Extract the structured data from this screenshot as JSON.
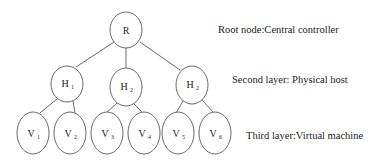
{
  "diagram": {
    "nodes": {
      "root": {
        "label": "R"
      },
      "hosts": [
        {
          "label": "H",
          "sub": "1"
        },
        {
          "label": "H",
          "sub": "2"
        },
        {
          "label": "H",
          "sub": "2"
        }
      ],
      "vms": [
        {
          "label": "V",
          "sub": "1"
        },
        {
          "label": "V",
          "sub": "2"
        },
        {
          "label": "V",
          "sub": "3"
        },
        {
          "label": "V",
          "sub": "4"
        },
        {
          "label": "V",
          "sub": "5"
        },
        {
          "label": "V",
          "sub": "6"
        }
      ]
    },
    "edges": [
      [
        "R",
        "H1"
      ],
      [
        "R",
        "H2"
      ],
      [
        "R",
        "H3"
      ],
      [
        "H1",
        "V1"
      ],
      [
        "H1",
        "V2"
      ],
      [
        "H2",
        "V3"
      ],
      [
        "H2",
        "V4"
      ],
      [
        "H3",
        "V5"
      ],
      [
        "H3",
        "V6"
      ]
    ],
    "layer_labels": {
      "root": "Root node:Central controller",
      "second": "Second layer: Physical host",
      "third": "Third layer:Virtual machine"
    },
    "colors": {
      "stroke": "#6a6a6a",
      "text": "#222222",
      "background": "#ffffff"
    }
  }
}
